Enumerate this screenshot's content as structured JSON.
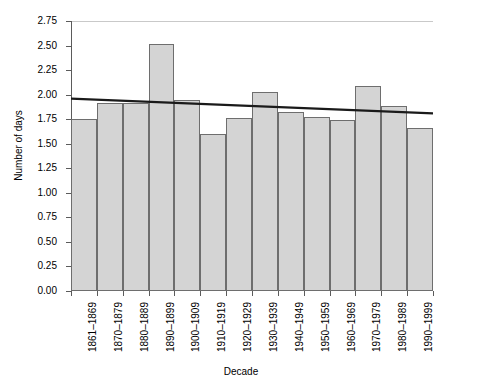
{
  "chart_data": {
    "type": "bar",
    "title": "",
    "xlabel": "Decade",
    "ylabel": "Number of days",
    "categories": [
      "1861–1869",
      "1870–1879",
      "1880–1889",
      "1890–1899",
      "1900–1909",
      "1910–1919",
      "1920–1929",
      "1930–1939",
      "1940–1949",
      "1950–1959",
      "1960–1969",
      "1970–1979",
      "1980–1989",
      "1990–1999"
    ],
    "values": [
      1.75,
      1.91,
      1.91,
      2.52,
      1.95,
      1.6,
      1.76,
      2.03,
      1.82,
      1.77,
      1.74,
      2.09,
      1.88,
      1.66
    ],
    "ylim": [
      0.0,
      2.75
    ],
    "ytick_labels": [
      "0.00",
      "0.25",
      "0.50",
      "0.75",
      "1.00",
      "1.25",
      "1.50",
      "1.75",
      "2.00",
      "2.25",
      "2.50",
      "2.75"
    ],
    "ytick_values": [
      0.0,
      0.25,
      0.5,
      0.75,
      1.0,
      1.25,
      1.5,
      1.75,
      2.0,
      2.25,
      2.5,
      2.75
    ],
    "grid": false,
    "legend": "none",
    "bar_fill_color": "#d4d4d4",
    "bar_edge_color": "#6e6e6e",
    "series": [
      {
        "name": "Number of days",
        "type": "bar",
        "values": [
          1.75,
          1.91,
          1.91,
          2.52,
          1.95,
          1.6,
          1.76,
          2.03,
          1.82,
          1.77,
          1.74,
          2.09,
          1.88,
          1.66
        ]
      },
      {
        "name": "Linear trend",
        "type": "line",
        "color": "#1a1a1a",
        "start_value": 1.96,
        "end_value": 1.81
      }
    ]
  }
}
